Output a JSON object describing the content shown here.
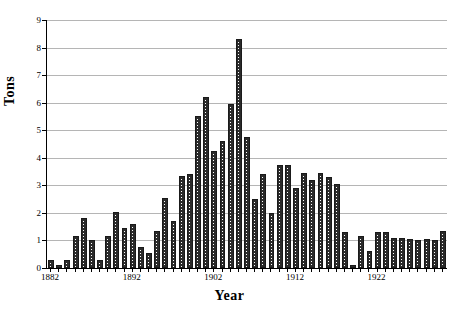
{
  "chart_data": {
    "type": "bar",
    "title": "",
    "xlabel": "Year",
    "ylabel": "Tons",
    "xlim": [
      1881.5,
      1930.5
    ],
    "ylim": [
      0,
      9
    ],
    "ytick_values": [
      0,
      1,
      2,
      3,
      4,
      5,
      6,
      7,
      8,
      9
    ],
    "ytick_labels": [
      "0",
      "1",
      "2",
      "3",
      "4",
      "5",
      "6",
      "7",
      "8",
      "9"
    ],
    "xtick_values": [
      1882,
      1892,
      1902,
      1912,
      1922
    ],
    "xtick_labels": [
      "1882",
      "1892",
      "1902",
      "1912",
      "1922"
    ],
    "grid": true,
    "legend": false,
    "bar_style": {
      "fill": "crosshatch",
      "edge_color": "#1a1a1a",
      "pattern_color": "#2b2b2b",
      "background_color": "#ffffff"
    },
    "categories": [
      1882,
      1883,
      1884,
      1885,
      1886,
      1887,
      1888,
      1889,
      1890,
      1891,
      1892,
      1893,
      1894,
      1895,
      1896,
      1897,
      1898,
      1899,
      1900,
      1901,
      1902,
      1903,
      1904,
      1905,
      1906,
      1907,
      1908,
      1909,
      1910,
      1911,
      1912,
      1913,
      1914,
      1915,
      1916,
      1917,
      1918,
      1919,
      1920,
      1921,
      1922,
      1923,
      1924,
      1925,
      1926,
      1927,
      1928,
      1929,
      1930
    ],
    "values": [
      0.3,
      0.1,
      0.3,
      1.15,
      1.8,
      1.0,
      0.3,
      1.15,
      2.05,
      1.45,
      1.6,
      0.75,
      0.55,
      1.35,
      2.55,
      1.7,
      3.35,
      3.4,
      5.5,
      6.2,
      4.25,
      4.6,
      5.95,
      8.3,
      4.75,
      2.5,
      3.4,
      2.0,
      3.75,
      3.75,
      2.9,
      3.45,
      3.2,
      3.45,
      3.3,
      3.05,
      1.3,
      0.1,
      1.15,
      0.6,
      1.3,
      1.3,
      1.1,
      1.1,
      1.05,
      1.0,
      1.05,
      1.0,
      1.35
    ]
  }
}
